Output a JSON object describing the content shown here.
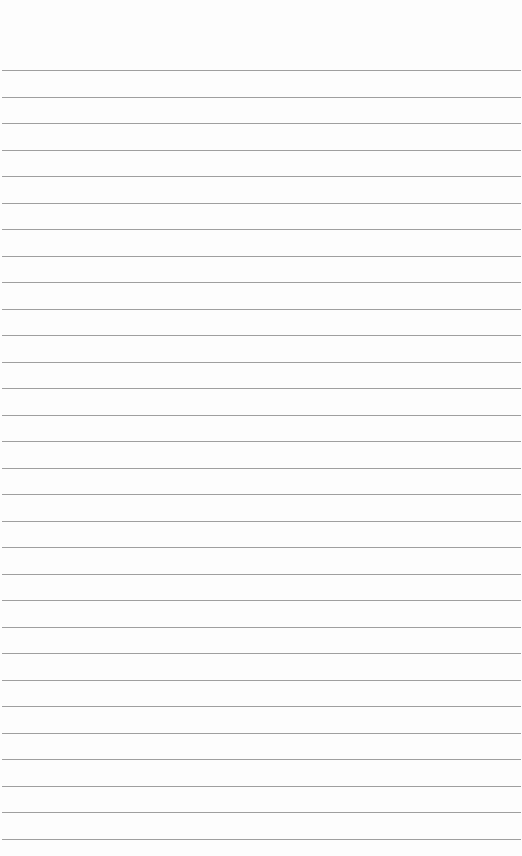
{
  "page": {
    "type": "lined-paper",
    "background": "#fdfdfd",
    "rule_color": "#8e8e8e",
    "first_rule_y": 70,
    "rule_spacing": 26.5,
    "rule_count": 30
  }
}
